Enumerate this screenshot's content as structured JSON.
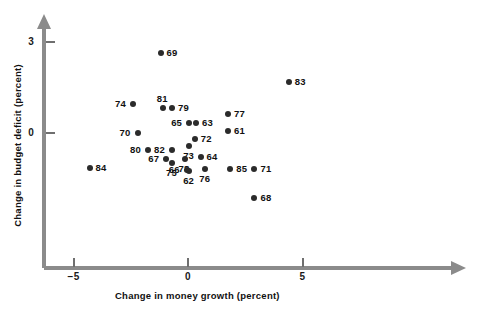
{
  "chart_data": {
    "type": "scatter",
    "title": "",
    "xlabel": "Change in money growth (percent)",
    "ylabel": "Change in budget deficit (percent)",
    "xlim": [
      -6.0,
      6.5
    ],
    "ylim": [
      -1.9,
      3.6
    ],
    "xticks": [
      -5,
      0,
      5
    ],
    "xticklabels": [
      "−5",
      "0",
      "5"
    ],
    "yticks": [
      0,
      3
    ],
    "yticklabels": [
      "0",
      "3"
    ],
    "grid": false,
    "legend": false,
    "point_label_field": "year",
    "points": [
      {
        "year": "69",
        "x": -1.2,
        "y": 2.65,
        "label_pos": "right"
      },
      {
        "year": "83",
        "x": 4.4,
        "y": 1.68,
        "label_pos": "right"
      },
      {
        "year": "74",
        "x": -2.4,
        "y": 0.96,
        "label_pos": "left"
      },
      {
        "year": "81",
        "x": -1.1,
        "y": 0.82,
        "label_pos": "above"
      },
      {
        "year": "79",
        "x": -0.7,
        "y": 0.82,
        "label_pos": "right"
      },
      {
        "year": "77",
        "x": 1.75,
        "y": 0.63,
        "label_pos": "right"
      },
      {
        "year": "65",
        "x": 0.05,
        "y": 0.33,
        "label_pos": "left"
      },
      {
        "year": "63",
        "x": 0.35,
        "y": 0.33,
        "label_pos": "right"
      },
      {
        "year": "70",
        "x": -2.2,
        "y": 0.0,
        "label_pos": "left"
      },
      {
        "year": "61",
        "x": 1.75,
        "y": 0.07,
        "label_pos": "right"
      },
      {
        "year": "72",
        "x": 0.3,
        "y": -0.2,
        "label_pos": "right"
      },
      {
        "year": "80",
        "x": -1.75,
        "y": -0.56,
        "label_pos": "left"
      },
      {
        "year": "82",
        "x": -0.7,
        "y": -0.56,
        "label_pos": "left"
      },
      {
        "year": "73",
        "x": 0.05,
        "y": -0.43,
        "label_pos": "below"
      },
      {
        "year": "67",
        "x": -0.95,
        "y": -0.86,
        "label_pos": "left"
      },
      {
        "year": "78",
        "x": -0.15,
        "y": -0.86,
        "label_pos": "below"
      },
      {
        "year": "64",
        "x": 0.55,
        "y": -0.79,
        "label_pos": "right"
      },
      {
        "year": "75",
        "x": -0.7,
        "y": -0.99,
        "label_pos": "below"
      },
      {
        "year": "76",
        "x": 0.75,
        "y": -1.19,
        "label_pos": "below"
      },
      {
        "year": "66",
        "x": -0.05,
        "y": -1.22,
        "label_pos": "left"
      },
      {
        "year": "62",
        "x": 0.05,
        "y": -1.26,
        "label_pos": "below"
      },
      {
        "year": "84",
        "x": -4.3,
        "y": -1.16,
        "label_pos": "right"
      },
      {
        "year": "85",
        "x": 1.85,
        "y": -1.19,
        "label_pos": "right"
      },
      {
        "year": "71",
        "x": 2.9,
        "y": -1.19,
        "label_pos": "right"
      },
      {
        "year": "68",
        "x": 2.9,
        "y": -2.15,
        "label_pos": "right"
      }
    ]
  },
  "colors": {
    "point": "#2b2b2b",
    "axis": "#8b8b8b",
    "text": "#111111",
    "background": "#ffffff"
  }
}
